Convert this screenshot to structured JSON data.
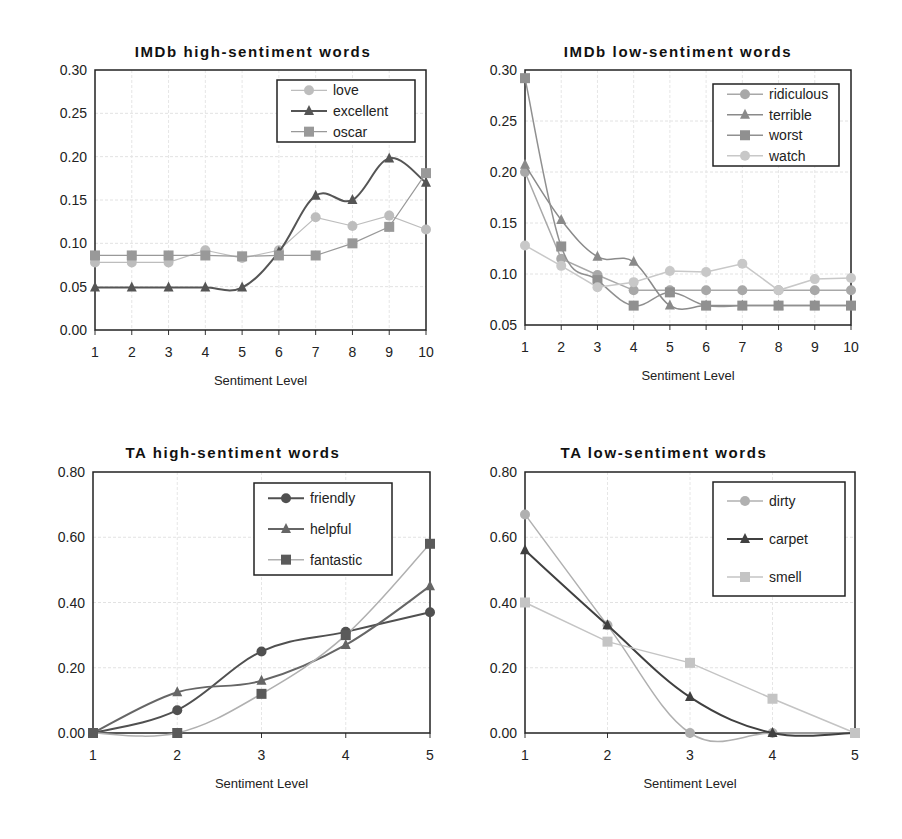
{
  "chart_data": [
    {
      "type": "line",
      "title": "IMDb high-sentiment words",
      "xlabel": "Sentiment Level",
      "ylabel": "",
      "x": [
        1,
        2,
        3,
        4,
        5,
        6,
        7,
        8,
        9,
        10
      ],
      "xticks": [
        "1",
        "2",
        "3",
        "4",
        "5",
        "6",
        "7",
        "8",
        "9",
        "10"
      ],
      "ylim": [
        0,
        0.3
      ],
      "yticks": [
        "0.00",
        "0.05",
        "0.10",
        "0.15",
        "0.20",
        "0.25",
        "0.30"
      ],
      "grid": true,
      "legend_position": "upper right",
      "series": [
        {
          "name": "love",
          "marker": "circle",
          "color": "#bdbdbd",
          "width": 1.2,
          "smooth": false,
          "values": [
            0.078,
            0.078,
            0.078,
            0.092,
            0.083,
            0.092,
            0.13,
            0.12,
            0.132,
            0.116
          ]
        },
        {
          "name": "excellent",
          "marker": "triangle",
          "color": "#555555",
          "width": 2,
          "smooth": true,
          "values": [
            0.049,
            0.049,
            0.049,
            0.049,
            0.049,
            0.09,
            0.155,
            0.15,
            0.198,
            0.17
          ]
        },
        {
          "name": "oscar",
          "marker": "square",
          "color": "#999999",
          "width": 1.2,
          "smooth": false,
          "values": [
            0.086,
            0.086,
            0.086,
            0.086,
            0.085,
            0.086,
            0.086,
            0.1,
            0.119,
            0.181
          ]
        }
      ]
    },
    {
      "type": "line",
      "title": "IMDb low-sentiment words",
      "xlabel": "Sentiment Level",
      "ylabel": "",
      "x": [
        1,
        2,
        3,
        4,
        5,
        6,
        7,
        8,
        9,
        10
      ],
      "xticks": [
        "1",
        "2",
        "3",
        "4",
        "5",
        "6",
        "7",
        "8",
        "9",
        "10"
      ],
      "ylim": [
        0.05,
        0.3
      ],
      "yticks": [
        "0.05",
        "0.10",
        "0.15",
        "0.20",
        "0.25",
        "0.30"
      ],
      "grid": true,
      "legend_position": "upper right",
      "series": [
        {
          "name": "ridiculous",
          "marker": "circle",
          "color": "#a8a8a8",
          "width": 1.5,
          "smooth": false,
          "values": [
            0.2,
            0.115,
            0.099,
            0.084,
            0.084,
            0.084,
            0.084,
            0.084,
            0.084,
            0.084
          ]
        },
        {
          "name": "terrible",
          "marker": "triangle",
          "color": "#8a8a8a",
          "width": 1.5,
          "smooth": true,
          "values": [
            0.207,
            0.153,
            0.117,
            0.112,
            0.069,
            0.069,
            0.069,
            0.069,
            0.069,
            0.069
          ]
        },
        {
          "name": "worst",
          "marker": "square",
          "color": "#909090",
          "width": 1.5,
          "smooth": true,
          "values": [
            0.292,
            0.127,
            0.094,
            0.069,
            0.082,
            0.069,
            0.069,
            0.069,
            0.069,
            0.069
          ]
        },
        {
          "name": "watch",
          "marker": "circle",
          "color": "#c8c8c8",
          "width": 1.5,
          "smooth": false,
          "values": [
            0.128,
            0.108,
            0.087,
            0.092,
            0.103,
            0.102,
            0.11,
            0.084,
            0.095,
            0.096
          ]
        }
      ]
    },
    {
      "type": "line",
      "title": "TA high-sentiment words",
      "xlabel": "Sentiment Level",
      "ylabel": "",
      "x": [
        1,
        2,
        3,
        4,
        5
      ],
      "xticks": [
        "1",
        "2",
        "3",
        "4",
        "5"
      ],
      "ylim": [
        0,
        0.8
      ],
      "yticks": [
        "0.00",
        "0.20",
        "0.40",
        "0.60",
        "0.80"
      ],
      "grid": true,
      "legend_position": "upper right",
      "series": [
        {
          "name": "friendly",
          "marker": "circle",
          "color": "#505050",
          "width": 2,
          "smooth": true,
          "values": [
            0.0,
            0.07,
            0.25,
            0.31,
            0.37
          ]
        },
        {
          "name": "helpful",
          "marker": "triangle",
          "color": "#666666",
          "width": 2,
          "smooth": true,
          "values": [
            0.0,
            0.125,
            0.16,
            0.27,
            0.45
          ]
        },
        {
          "name": "fantastic",
          "marker": "square",
          "color": "#5a5a5a",
          "line_color": "#b0b0b0",
          "width": 1.5,
          "smooth": true,
          "values": [
            0.0,
            0.0,
            0.12,
            0.3,
            0.58
          ]
        }
      ]
    },
    {
      "type": "line",
      "title": "TA low-sentiment words",
      "xlabel": "Sentiment Level",
      "ylabel": "",
      "x": [
        1,
        2,
        3,
        4,
        5
      ],
      "xticks": [
        "1",
        "2",
        "3",
        "4",
        "5"
      ],
      "ylim": [
        0,
        0.8
      ],
      "yticks": [
        "0.00",
        "0.20",
        "0.40",
        "0.60",
        "0.80"
      ],
      "grid": true,
      "legend_position": "upper right",
      "series": [
        {
          "name": "dirty",
          "marker": "circle",
          "color": "#b0b0b0",
          "width": 1.5,
          "smooth": true,
          "values": [
            0.67,
            0.33,
            0.0,
            0.0,
            0.0
          ]
        },
        {
          "name": "carpet",
          "marker": "triangle",
          "color": "#404040",
          "width": 2,
          "smooth": true,
          "values": [
            0.56,
            0.33,
            0.11,
            0.0,
            0.0
          ]
        },
        {
          "name": "smell",
          "marker": "square",
          "color": "#c4c4c4",
          "width": 1.5,
          "smooth": false,
          "values": [
            0.4,
            0.28,
            0.215,
            0.105,
            0.0
          ]
        }
      ]
    }
  ]
}
